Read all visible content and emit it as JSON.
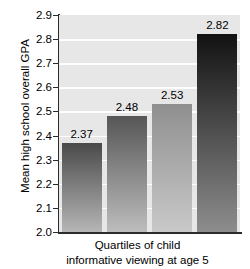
{
  "chart_data": {
    "type": "bar",
    "title": "",
    "xlabel": "Quartiles of child informative viewing at age 5",
    "xlabel_line1": "Quartiles of child",
    "xlabel_line2": "informative viewing at age 5",
    "ylabel": "Mean high school overall GPA",
    "categories": [
      "1",
      "2",
      "3",
      "4"
    ],
    "values": [
      2.37,
      2.48,
      2.53,
      2.82
    ],
    "value_labels": [
      "2.37",
      "2.48",
      "2.53",
      "2.82"
    ],
    "ylim": [
      2.0,
      2.9
    ],
    "ytick_step": 0.1,
    "ytick_labels": [
      "2.9",
      "2.8",
      "2.7",
      "2.6",
      "2.5",
      "2.4",
      "2.3",
      "2.2",
      "2.1",
      "2.0"
    ],
    "ytick_values": [
      2.9,
      2.8,
      2.7,
      2.6,
      2.5,
      2.4,
      2.3,
      2.2,
      2.1,
      2.0
    ],
    "grid": true,
    "legend": "none",
    "plot_background_color": "#e7e7e7",
    "gridline_color": "#fdfdfd",
    "axis_color": "#2b2b2b",
    "bar_colors_top": [
      "#4a4a4a",
      "#565656",
      "#8f8f8f",
      "#121212"
    ],
    "bar_colors_bottom": [
      "#b6b6b6",
      "#bdbdbd",
      "#c9c9c9",
      "#8d8d8d"
    ]
  }
}
